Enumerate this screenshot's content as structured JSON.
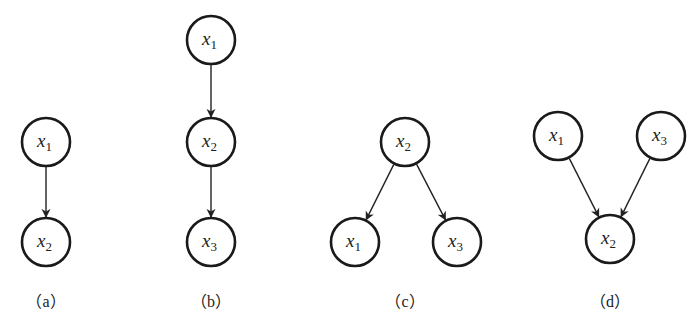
{
  "panels": [
    {
      "id": "a",
      "caption": "（a）",
      "cx": 46,
      "nodes": [
        {
          "var": "x",
          "sub": "1",
          "x": 46,
          "y": 142
        },
        {
          "var": "x",
          "sub": "2",
          "x": 46,
          "y": 242
        }
      ],
      "edges": [
        [
          0,
          1
        ]
      ]
    },
    {
      "id": "b",
      "caption": "（b）",
      "cx": 211,
      "nodes": [
        {
          "var": "x",
          "sub": "1",
          "x": 211,
          "y": 40
        },
        {
          "var": "x",
          "sub": "2",
          "x": 211,
          "y": 142
        },
        {
          "var": "x",
          "sub": "3",
          "x": 211,
          "y": 242
        }
      ],
      "edges": [
        [
          0,
          1
        ],
        [
          1,
          2
        ]
      ]
    },
    {
      "id": "c",
      "caption": "（c）",
      "cx": 405,
      "nodes": [
        {
          "var": "x",
          "sub": "2",
          "x": 405,
          "y": 142
        },
        {
          "var": "x",
          "sub": "1",
          "x": 355,
          "y": 242
        },
        {
          "var": "x",
          "sub": "3",
          "x": 457,
          "y": 242
        }
      ],
      "edges": [
        [
          0,
          1
        ],
        [
          0,
          2
        ]
      ]
    },
    {
      "id": "d",
      "caption": "（d）",
      "cx": 610,
      "nodes": [
        {
          "var": "x",
          "sub": "1",
          "x": 558,
          "y": 136
        },
        {
          "var": "x",
          "sub": "3",
          "x": 661,
          "y": 136
        },
        {
          "var": "x",
          "sub": "2",
          "x": 610,
          "y": 239
        }
      ],
      "edges": [
        [
          0,
          2
        ],
        [
          1,
          2
        ]
      ]
    }
  ],
  "node_radius": 24,
  "colors": {
    "stroke": "#1a1a1a",
    "background": "#ffffff"
  }
}
